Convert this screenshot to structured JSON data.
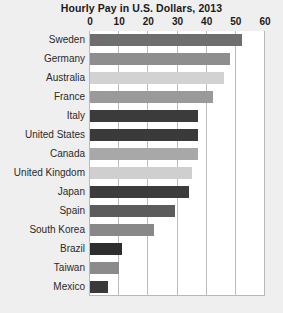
{
  "chart_data": {
    "type": "bar",
    "orientation": "horizontal",
    "title": "Hourly Pay in U.S. Dollars, 2013",
    "xlabel": "",
    "ylabel": "",
    "xlim": [
      0,
      60
    ],
    "xticks": [
      0,
      10,
      20,
      30,
      40,
      50,
      60
    ],
    "xtick_labels": [
      "0",
      "10",
      "20",
      "30",
      "40",
      "50",
      "60"
    ],
    "grid": true,
    "legend": "none",
    "categories": [
      "Sweden",
      "Germany",
      "Australia",
      "France",
      "Italy",
      "United States",
      "Canada",
      "United Kingdom",
      "Japan",
      "Spain",
      "South Korea",
      "Brazil",
      "Taiwan",
      "Mexico"
    ],
    "values": [
      52,
      48,
      46,
      42,
      37,
      37,
      37,
      35,
      34,
      29,
      22,
      11,
      10,
      6
    ],
    "bar_colors": [
      "#6e6e6e",
      "#8e8e8e",
      "#d2d2d2",
      "#9a9a9a",
      "#3b3b3b",
      "#3a3a3a",
      "#a8a8a8",
      "#cfcfcf",
      "#3c3c3c",
      "#5c5c5c",
      "#888888",
      "#2e2e2e",
      "#8b8b8b",
      "#3a3a3a"
    ],
    "plot_background": "#ffffff",
    "figure_background": "#efefef",
    "gridline_color": "#bdbdbd"
  }
}
